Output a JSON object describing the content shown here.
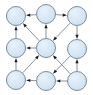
{
  "figure": {
    "width": 93,
    "height": 95,
    "background": "#ffffff"
  },
  "style": {
    "node_fill": "#cadff0",
    "node_fill_highlight": "#e8f2fb",
    "node_stroke": "#7f8c93",
    "node_radius": 9.5,
    "edge_color": "#8b9196",
    "arrow_color": "#1b1b1b"
  },
  "graph": {
    "type": "directed",
    "node_count": 9,
    "edge_count": 14,
    "nodes": [
      {
        "id": "n-top-left",
        "label": "",
        "x": 16,
        "y": 16
      },
      {
        "id": "n-top-center",
        "label": "",
        "x": 46,
        "y": 14
      },
      {
        "id": "n-top-right",
        "label": "",
        "x": 77,
        "y": 16
      },
      {
        "id": "n-mid-left",
        "label": "",
        "x": 16,
        "y": 48
      },
      {
        "id": "n-mid-center",
        "label": "",
        "x": 46,
        "y": 48
      },
      {
        "id": "n-mid-right",
        "label": "",
        "x": 77,
        "y": 49
      },
      {
        "id": "n-bottom-left",
        "label": "",
        "x": 16,
        "y": 80
      },
      {
        "id": "n-bottom-center",
        "label": "",
        "x": 46,
        "y": 81
      },
      {
        "id": "n-bottom-right",
        "label": "",
        "x": 77,
        "y": 81
      }
    ],
    "edges": [
      {
        "from": "n-top-center",
        "to": "n-top-left",
        "kind": "horizontal"
      },
      {
        "from": "n-top-center",
        "to": "n-top-right",
        "kind": "horizontal"
      },
      {
        "from": "n-mid-center",
        "to": "n-mid-left",
        "kind": "horizontal"
      },
      {
        "from": "n-bottom-center",
        "to": "n-bottom-left",
        "kind": "horizontal"
      },
      {
        "from": "n-bottom-right",
        "to": "n-bottom-center",
        "kind": "horizontal"
      },
      {
        "from": "n-mid-left",
        "to": "n-top-left",
        "kind": "vertical"
      },
      {
        "from": "n-bottom-left",
        "to": "n-mid-left",
        "kind": "vertical"
      },
      {
        "from": "n-mid-center",
        "to": "n-top-center",
        "kind": "vertical"
      },
      {
        "from": "n-top-right",
        "to": "n-mid-right",
        "kind": "vertical"
      },
      {
        "from": "n-bottom-right",
        "to": "n-mid-right",
        "kind": "vertical"
      },
      {
        "from": "n-mid-center",
        "to": "n-top-left",
        "kind": "diagonal"
      },
      {
        "from": "n-bottom-left",
        "to": "n-mid-center",
        "kind": "diagonal"
      },
      {
        "from": "n-top-right",
        "to": "n-mid-center",
        "kind": "diagonal"
      },
      {
        "from": "n-bottom-right",
        "to": "n-mid-center",
        "kind": "diagonal"
      },
      {
        "from": "n-mid-right",
        "to": "n-bottom-center",
        "kind": "diagonal"
      }
    ]
  }
}
